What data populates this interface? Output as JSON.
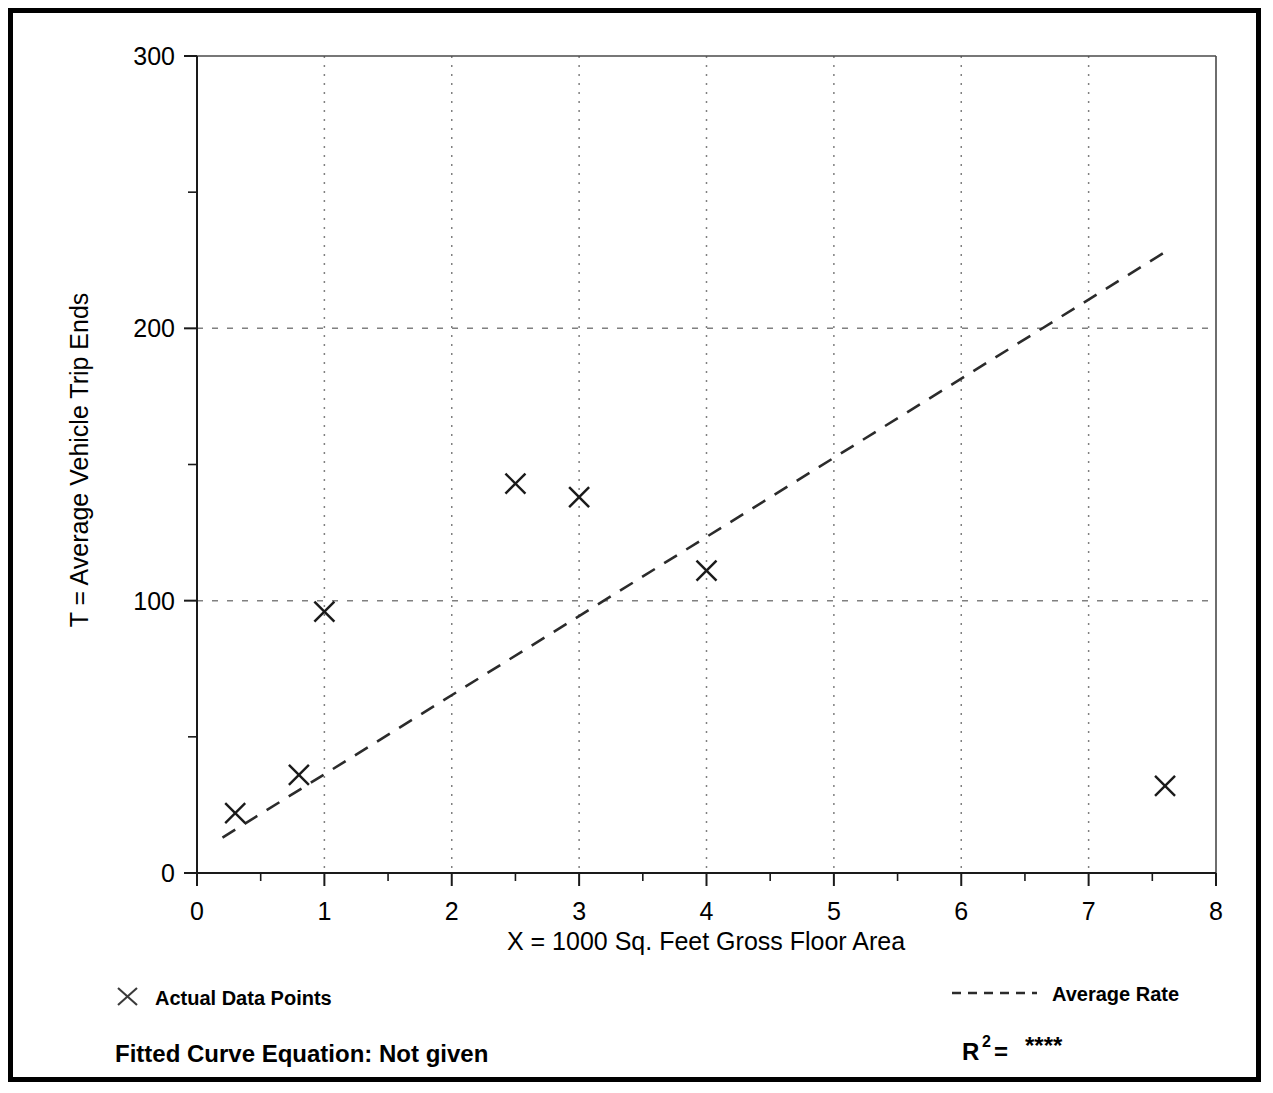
{
  "chart_data": {
    "type": "scatter",
    "title": "",
    "xlabel": "X = 1000 Sq. Feet Gross Floor Area",
    "ylabel": "T = Average Vehicle Trip Ends",
    "xlim": [
      0,
      8
    ],
    "ylim": [
      0,
      300
    ],
    "grid": true,
    "x_ticks": [
      0,
      1,
      2,
      3,
      4,
      5,
      6,
      7,
      8
    ],
    "x_tick_labels": [
      "0",
      "1",
      "2",
      "3",
      "4",
      "5",
      "6",
      "7",
      "8"
    ],
    "x_minor_ticks": [
      0.5,
      1.5,
      2.5,
      3.5,
      4.5,
      5.5,
      6.5,
      7.5
    ],
    "y_ticks": [
      0,
      100,
      200,
      300
    ],
    "y_tick_labels": [
      "0",
      "100",
      "200",
      "300"
    ],
    "y_minor_ticks": [
      50,
      150,
      250
    ],
    "gridlines_v": [
      1,
      2,
      3,
      4,
      5,
      6,
      7
    ],
    "gridlines_h": [
      100,
      200
    ],
    "series": [
      {
        "name": "Actual Data Points",
        "type": "scatter",
        "marker": "x",
        "points": [
          {
            "x": 0.3,
            "y": 22
          },
          {
            "x": 0.8,
            "y": 36
          },
          {
            "x": 1.0,
            "y": 96
          },
          {
            "x": 2.5,
            "y": 143
          },
          {
            "x": 3.0,
            "y": 138
          },
          {
            "x": 4.0,
            "y": 111
          },
          {
            "x": 7.6,
            "y": 32
          }
        ]
      },
      {
        "name": "Average Rate",
        "type": "line",
        "style": "dashed",
        "endpoints": [
          {
            "x": 0.2,
            "y": 13
          },
          {
            "x": 7.6,
            "y": 228
          }
        ]
      }
    ]
  },
  "legend": {
    "data_points_label": "Actual Data Points",
    "average_rate_label": "Average Rate",
    "data_points_marker": "x-marker-icon",
    "average_rate_marker": "dashed-line-icon"
  },
  "footer": {
    "fitted_curve_text": "Fitted Curve Equation:  Not given",
    "r_squared_base": "R",
    "r_squared_exponent": "2",
    "r_squared_equals": " = ",
    "r_squared_value": "****"
  },
  "colors": {
    "frame": "#000000",
    "axis": "#1a1a1a",
    "grid": "#808080",
    "marker": "#1a1a1a",
    "trendline": "#2b2b2b",
    "background": "#ffffff"
  }
}
